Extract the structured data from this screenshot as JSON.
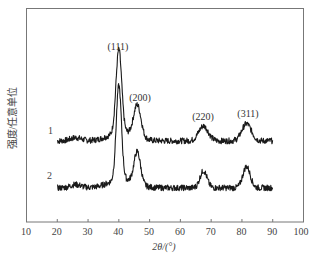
{
  "chart_data": {
    "type": "line",
    "title": "",
    "xlabel": "2θ/(°)",
    "ylabel": "强度/任意单位",
    "xlim": [
      10,
      100
    ],
    "xticks": [
      10,
      20,
      30,
      40,
      50,
      60,
      70,
      80,
      90,
      100
    ],
    "xtick_labels": [
      "10",
      "20",
      "30",
      "40",
      "50",
      "60",
      "70",
      "80",
      "90",
      "100"
    ],
    "yticks": [],
    "grid": false,
    "legend": "inline curve labels",
    "series": [
      {
        "name": "1",
        "x_range": [
          20,
          90
        ],
        "baseline": 0.38,
        "peaks": [
          {
            "label": "(111)",
            "x": 40,
            "height": 0.77
          },
          {
            "label": "(200)",
            "x": 46,
            "height": 0.53
          },
          {
            "label": "(220)",
            "x": 67.5,
            "height": 0.45
          },
          {
            "label": "(311)",
            "x": 81.5,
            "height": 0.46
          }
        ]
      },
      {
        "name": "2",
        "x_range": [
          20,
          90
        ],
        "baseline": 0.16,
        "peaks": [
          {
            "label": "(111)",
            "x": 40,
            "height": 0.6
          },
          {
            "label": "(200)",
            "x": 46,
            "height": 0.31
          },
          {
            "label": "(220)",
            "x": 67.5,
            "height": 0.24
          },
          {
            "label": "(311)",
            "x": 81.5,
            "height": 0.26
          }
        ]
      }
    ],
    "annotations": [
      {
        "text": "(111)",
        "x": 40
      },
      {
        "text": "(200)",
        "x": 46
      },
      {
        "text": "(220)",
        "x": 67.5
      },
      {
        "text": "(311)",
        "x": 81.5
      }
    ]
  },
  "labels": {
    "xaxis_title": "2θ/(°)",
    "yaxis_title": "强度/任意单位",
    "series1": "1",
    "series2": "2",
    "peak111": "(111)",
    "peak200": "(200)",
    "peak220": "(220)",
    "peak311": "(311)",
    "ticks": [
      "10",
      "20",
      "30",
      "40",
      "50",
      "60",
      "70",
      "80",
      "90",
      "100"
    ]
  }
}
